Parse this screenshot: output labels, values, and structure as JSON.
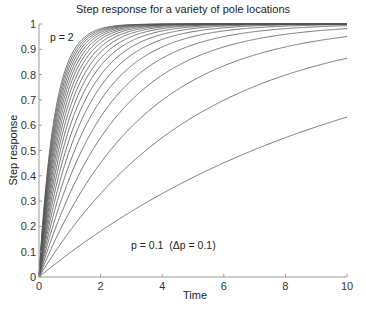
{
  "chart_data": {
    "type": "line",
    "title": "Step response for a variety of pole locations",
    "xlabel": "Time",
    "ylabel": "Step response",
    "xlim": [
      0,
      10
    ],
    "ylim": [
      0,
      1
    ],
    "xticks": [
      0,
      2,
      4,
      6,
      8,
      10
    ],
    "yticks": [
      0,
      0.1,
      0.2,
      0.3,
      0.4,
      0.5,
      0.6,
      0.7,
      0.8,
      0.9,
      1
    ],
    "grid": false,
    "legend": "none",
    "formula": "y = 1 - exp(-p t)",
    "series_params": {
      "p_start": 0.1,
      "p_end": 2.0,
      "p_step": 0.1,
      "count": 20
    },
    "series": [
      {
        "name": "p = 0.1",
        "p": 0.1,
        "y_at_t10": 0.632
      },
      {
        "name": "p = 0.2",
        "p": 0.2,
        "y_at_t10": 0.865
      },
      {
        "name": "p = 0.3",
        "p": 0.3,
        "y_at_t10": 0.95
      },
      {
        "name": "p = 0.4",
        "p": 0.4,
        "y_at_t10": 0.982
      },
      {
        "name": "p = 0.5",
        "p": 0.5,
        "y_at_t10": 0.993
      },
      {
        "name": "p = 0.6",
        "p": 0.6,
        "y_at_t10": 0.998
      },
      {
        "name": "p = 0.7",
        "p": 0.7,
        "y_at_t10": 0.999
      },
      {
        "name": "p = 0.8",
        "p": 0.8,
        "y_at_t10": 1.0
      },
      {
        "name": "p = 0.9",
        "p": 0.9,
        "y_at_t10": 1.0
      },
      {
        "name": "p = 1.0",
        "p": 1.0,
        "y_at_t10": 1.0
      },
      {
        "name": "p = 1.1",
        "p": 1.1,
        "y_at_t10": 1.0
      },
      {
        "name": "p = 1.2",
        "p": 1.2,
        "y_at_t10": 1.0
      },
      {
        "name": "p = 1.3",
        "p": 1.3,
        "y_at_t10": 1.0
      },
      {
        "name": "p = 1.4",
        "p": 1.4,
        "y_at_t10": 1.0
      },
      {
        "name": "p = 1.5",
        "p": 1.5,
        "y_at_t10": 1.0
      },
      {
        "name": "p = 1.6",
        "p": 1.6,
        "y_at_t10": 1.0
      },
      {
        "name": "p = 1.7",
        "p": 1.7,
        "y_at_t10": 1.0
      },
      {
        "name": "p = 1.8",
        "p": 1.8,
        "y_at_t10": 1.0
      },
      {
        "name": "p = 1.9",
        "p": 1.9,
        "y_at_t10": 1.0
      },
      {
        "name": "p = 2.0",
        "p": 2.0,
        "y_at_t10": 1.0
      }
    ],
    "annotations": [
      {
        "text": "p = 2",
        "x": 0.1,
        "y": 0.945
      },
      {
        "text": "p = 0.1  (Δp = 0.1)",
        "x": 3.0,
        "y": 0.105
      }
    ]
  },
  "colors": {
    "line": "#555555",
    "axis": "#999999",
    "text": "#222222"
  }
}
